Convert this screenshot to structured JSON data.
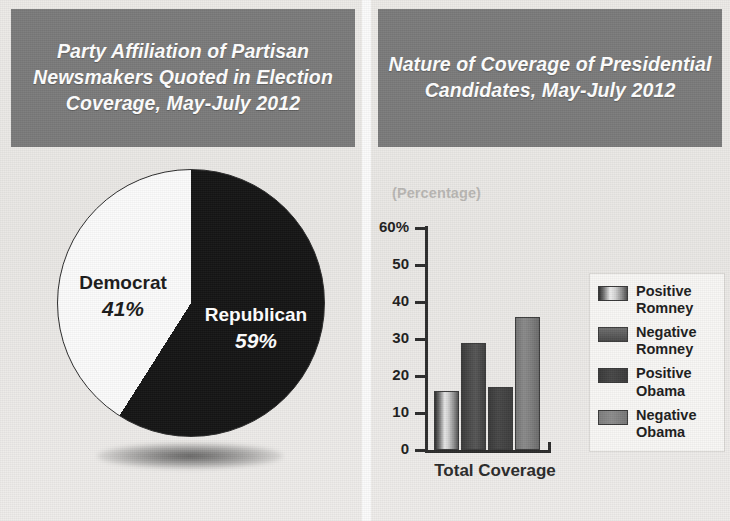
{
  "panels": {
    "left": {
      "title": "Party Affiliation of Partisan Newsmakers Quoted in Election Coverage, May-July 2012"
    },
    "right": {
      "title": "Nature of Coverage of Presidential Candidates, May-July 2012"
    }
  },
  "colors": {
    "title_band": "#7b7b7b",
    "title_text": "#ffffff",
    "page_background": "#eceae7",
    "pie_republican": "#151515",
    "pie_democrat": "#fbfbfb",
    "axis": "#2c2c2c",
    "percentage_label": "#b9b7b4"
  },
  "chart_data": [
    {
      "type": "pie",
      "title": "Party Affiliation of Partisan Newsmakers Quoted in Election Coverage, May-July 2012",
      "labels": [
        "Republican",
        "Democrat"
      ],
      "values": [
        59,
        41
      ],
      "value_labels": [
        "59%",
        "41%"
      ],
      "slice_colors": [
        "#151515",
        "#fbfbfb"
      ],
      "legend": "none",
      "slices": [
        {
          "label": "Republican",
          "value": 59,
          "value_label": "59%",
          "color": "#151515",
          "text_color": "#ffffff"
        },
        {
          "label": "Democrat",
          "value": 41,
          "value_label": "41%",
          "color": "#fbfbfb",
          "text_color": "#1b1b1b"
        }
      ]
    },
    {
      "type": "bar",
      "title": "Nature of Coverage of Presidential Candidates, May-July 2012",
      "unit_label": "(Percentage)",
      "xlabel": "Total Coverage",
      "ylabel": "",
      "categories": [
        "Total Coverage"
      ],
      "ylim": [
        0,
        60
      ],
      "yticks": [
        0,
        10,
        20,
        30,
        40,
        50,
        60
      ],
      "ytick_labels": [
        "0",
        "10",
        "20",
        "30",
        "40",
        "50",
        "60%"
      ],
      "grid": false,
      "legend_position": "right",
      "series": [
        {
          "name": "Positive Romney",
          "values": [
            16
          ],
          "color": "#cfcfcf"
        },
        {
          "name": "Negative Romney",
          "values": [
            29
          ],
          "color": "#4a4a4a"
        },
        {
          "name": "Positive Obama",
          "values": [
            17
          ],
          "color": "#3f3f3f"
        },
        {
          "name": "Negative Obama",
          "values": [
            36
          ],
          "color": "#8a8a8a"
        }
      ]
    }
  ]
}
